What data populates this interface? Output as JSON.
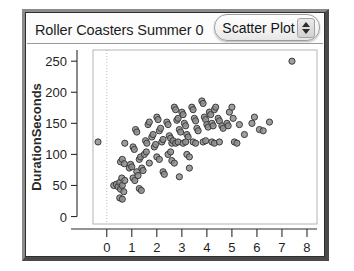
{
  "window": {
    "title": "Roller Coasters Summer 0",
    "plot_type_selector": {
      "value": "Scatter Plot",
      "stepper_up_icon": "triangle-up-icon",
      "stepper_down_icon": "triangle-down-icon"
    }
  },
  "chart_data": {
    "type": "scatter",
    "title": "Roller Coasters Summer 0",
    "xlabel_bold": "Length",
    "xlabel_unit": "(thousands)",
    "ylabel": "DurationSeconds",
    "xlim": [
      -0.55,
      8.4
    ],
    "ylim": [
      -12,
      268
    ],
    "xticks": [
      0,
      1,
      2,
      3,
      4,
      5,
      6,
      7,
      8
    ],
    "yticks": [
      0,
      50,
      100,
      150,
      200,
      250
    ],
    "xtick_labels": [
      "0",
      "1",
      "2",
      "3",
      "4",
      "5",
      "6",
      "7",
      "8"
    ],
    "ytick_labels": [
      "0",
      "50",
      "100",
      "150",
      "200",
      "250"
    ],
    "grid": false,
    "vertical_reference_line_x": 0,
    "legend": null,
    "marker": {
      "shape": "circle",
      "size_px": 5,
      "fill": "#8d8d8d",
      "edge": "#3c3c3c"
    },
    "points": [
      [
        -0.35,
        120
      ],
      [
        0.28,
        50
      ],
      [
        0.38,
        52
      ],
      [
        0.45,
        48
      ],
      [
        0.52,
        55
      ],
      [
        0.55,
        44
      ],
      [
        0.6,
        62
      ],
      [
        0.62,
        50
      ],
      [
        0.68,
        40
      ],
      [
        0.72,
        58
      ],
      [
        0.52,
        30
      ],
      [
        0.62,
        28
      ],
      [
        0.55,
        88
      ],
      [
        0.62,
        92
      ],
      [
        0.7,
        85
      ],
      [
        0.72,
        118
      ],
      [
        0.9,
        78
      ],
      [
        0.95,
        84
      ],
      [
        1.0,
        80
      ],
      [
        1.05,
        112
      ],
      [
        1.1,
        108
      ],
      [
        1.15,
        140
      ],
      [
        1.2,
        136
      ],
      [
        1.05,
        62
      ],
      [
        1.12,
        58
      ],
      [
        1.2,
        72
      ],
      [
        1.25,
        66
      ],
      [
        1.3,
        92
      ],
      [
        1.35,
        96
      ],
      [
        1.4,
        78
      ],
      [
        1.45,
        74
      ],
      [
        1.3,
        45
      ],
      [
        1.38,
        42
      ],
      [
        1.55,
        122
      ],
      [
        1.6,
        118
      ],
      [
        1.65,
        148
      ],
      [
        1.7,
        152
      ],
      [
        1.5,
        100
      ],
      [
        1.58,
        104
      ],
      [
        1.8,
        128
      ],
      [
        1.85,
        132
      ],
      [
        1.9,
        112
      ],
      [
        1.95,
        116
      ],
      [
        1.7,
        86
      ],
      [
        2.0,
        160
      ],
      [
        2.05,
        156
      ],
      [
        2.1,
        138
      ],
      [
        2.15,
        142
      ],
      [
        2.2,
        120
      ],
      [
        2.25,
        124
      ],
      [
        2.0,
        96
      ],
      [
        2.1,
        92
      ],
      [
        2.25,
        72
      ],
      [
        2.3,
        68
      ],
      [
        2.4,
        152
      ],
      [
        2.45,
        148
      ],
      [
        2.5,
        130
      ],
      [
        2.55,
        126
      ],
      [
        2.6,
        118
      ],
      [
        2.65,
        122
      ],
      [
        2.45,
        100
      ],
      [
        2.55,
        104
      ],
      [
        2.7,
        176
      ],
      [
        2.75,
        172
      ],
      [
        2.8,
        155
      ],
      [
        2.85,
        158
      ],
      [
        2.9,
        140
      ],
      [
        2.95,
        136
      ],
      [
        2.75,
        118
      ],
      [
        2.85,
        120
      ],
      [
        2.6,
        90
      ],
      [
        2.7,
        86
      ],
      [
        2.9,
        64
      ],
      [
        3.0,
        168
      ],
      [
        3.05,
        164
      ],
      [
        3.1,
        150
      ],
      [
        3.15,
        146
      ],
      [
        3.2,
        132
      ],
      [
        3.25,
        128
      ],
      [
        3.05,
        118
      ],
      [
        3.15,
        120
      ],
      [
        3.2,
        100
      ],
      [
        3.3,
        96
      ],
      [
        3.4,
        176
      ],
      [
        3.45,
        172
      ],
      [
        3.5,
        158
      ],
      [
        3.55,
        154
      ],
      [
        3.6,
        142
      ],
      [
        3.65,
        138
      ],
      [
        3.45,
        120
      ],
      [
        3.55,
        118
      ],
      [
        3.3,
        78
      ],
      [
        3.8,
        186
      ],
      [
        3.85,
        182
      ],
      [
        3.9,
        160
      ],
      [
        3.95,
        156
      ],
      [
        4.0,
        148
      ],
      [
        4.05,
        144
      ],
      [
        3.85,
        120
      ],
      [
        3.95,
        122
      ],
      [
        4.1,
        168
      ],
      [
        4.15,
        164
      ],
      [
        4.2,
        150
      ],
      [
        4.25,
        146
      ],
      [
        4.3,
        172
      ],
      [
        4.35,
        176
      ],
      [
        4.2,
        120
      ],
      [
        4.3,
        118
      ],
      [
        4.45,
        158
      ],
      [
        4.5,
        154
      ],
      [
        4.6,
        146
      ],
      [
        4.65,
        142
      ],
      [
        4.5,
        120
      ],
      [
        4.8,
        150
      ],
      [
        4.85,
        146
      ],
      [
        4.9,
        168
      ],
      [
        5.0,
        176
      ],
      [
        5.05,
        158
      ],
      [
        5.1,
        120
      ],
      [
        5.2,
        118
      ],
      [
        5.3,
        148
      ],
      [
        5.5,
        132
      ],
      [
        5.8,
        150
      ],
      [
        5.9,
        160
      ],
      [
        6.1,
        140
      ],
      [
        6.25,
        138
      ],
      [
        6.5,
        152
      ],
      [
        7.4,
        250
      ]
    ]
  }
}
